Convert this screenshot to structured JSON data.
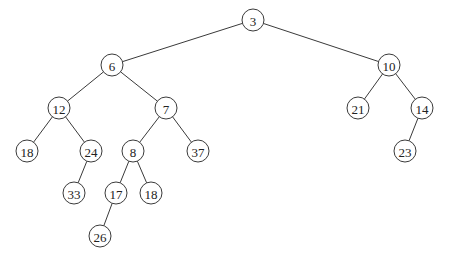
{
  "diagram": {
    "type": "binary-tree",
    "node_radius": 11,
    "stroke_color": "#3a3a3a",
    "fill_color": "#ffffff",
    "text_color": "#222222",
    "nodes": [
      {
        "id": "n3",
        "label": "3",
        "x": 253,
        "y": 20
      },
      {
        "id": "n6",
        "label": "6",
        "x": 112,
        "y": 65
      },
      {
        "id": "n10",
        "label": "10",
        "x": 389,
        "y": 65
      },
      {
        "id": "n12",
        "label": "12",
        "x": 59,
        "y": 108
      },
      {
        "id": "n7",
        "label": "7",
        "x": 166,
        "y": 108
      },
      {
        "id": "n21",
        "label": "21",
        "x": 358,
        "y": 108
      },
      {
        "id": "n14",
        "label": "14",
        "x": 422,
        "y": 108
      },
      {
        "id": "n18a",
        "label": "18",
        "x": 27,
        "y": 151
      },
      {
        "id": "n24",
        "label": "24",
        "x": 91,
        "y": 151
      },
      {
        "id": "n8",
        "label": "8",
        "x": 133,
        "y": 151
      },
      {
        "id": "n37",
        "label": "37",
        "x": 198,
        "y": 151
      },
      {
        "id": "n23",
        "label": "23",
        "x": 405,
        "y": 151
      },
      {
        "id": "n33",
        "label": "33",
        "x": 74,
        "y": 193
      },
      {
        "id": "n17",
        "label": "17",
        "x": 116,
        "y": 193
      },
      {
        "id": "n18b",
        "label": "18",
        "x": 151,
        "y": 193
      },
      {
        "id": "n26",
        "label": "26",
        "x": 100,
        "y": 236
      }
    ],
    "edges": [
      {
        "from": "n3",
        "to": "n6"
      },
      {
        "from": "n3",
        "to": "n10"
      },
      {
        "from": "n6",
        "to": "n12"
      },
      {
        "from": "n6",
        "to": "n7"
      },
      {
        "from": "n10",
        "to": "n21"
      },
      {
        "from": "n10",
        "to": "n14"
      },
      {
        "from": "n12",
        "to": "n18a"
      },
      {
        "from": "n12",
        "to": "n24"
      },
      {
        "from": "n7",
        "to": "n8"
      },
      {
        "from": "n7",
        "to": "n37"
      },
      {
        "from": "n14",
        "to": "n23"
      },
      {
        "from": "n24",
        "to": "n33"
      },
      {
        "from": "n8",
        "to": "n17"
      },
      {
        "from": "n8",
        "to": "n18b"
      },
      {
        "from": "n17",
        "to": "n26"
      }
    ]
  }
}
